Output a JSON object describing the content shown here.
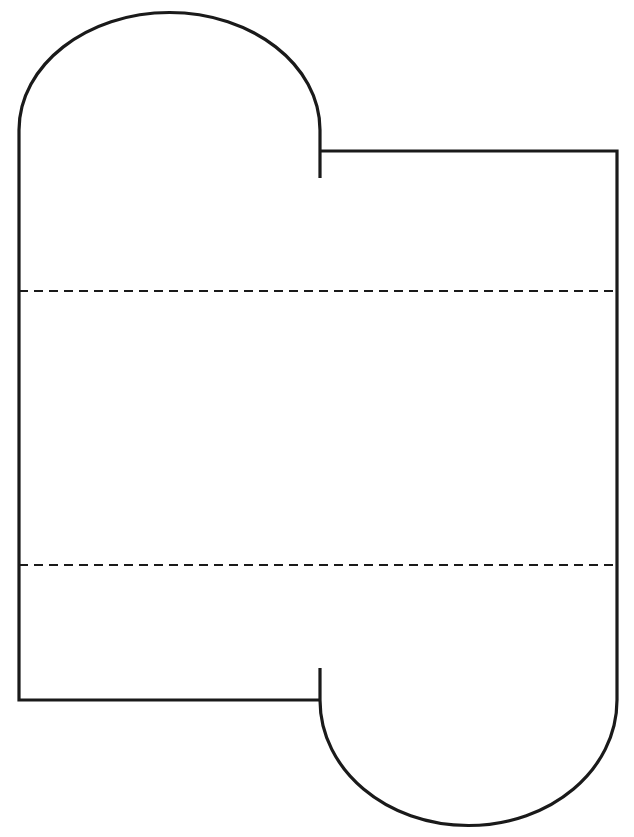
{
  "document": {
    "title": "Pattern Template Outline",
    "background_color": "#ffffff",
    "width": 634,
    "height": 837
  },
  "style": {
    "stroke_color": "#1a1a1a",
    "outline_stroke_width": 3.2,
    "fold_stroke_width": 2.2,
    "fold_dash_pattern": "9 6",
    "fill_color": "none"
  },
  "diagram": {
    "kind": "line-art-pattern-template",
    "shapes": [
      {
        "name": "left-panel-outline",
        "label": "Left panel with rounded top",
        "top_arc_apex_y": 12,
        "left_edge_x": 19,
        "right_edge_x": 320,
        "bottom_edge_y": 700,
        "arc_tangent_y": 130
      },
      {
        "name": "right-panel-outline",
        "label": "Right panel with rounded bottom",
        "top_edge_y": 151,
        "left_edge_x": 320,
        "right_edge_x": 617,
        "bottom_arc_base_y": 826,
        "arc_tangent_y": 700
      }
    ],
    "fold_lines": [
      {
        "name": "upper-fold-line",
        "label": "Upper dashed fold line",
        "y": 291,
        "x_start": 19,
        "x_end": 617
      },
      {
        "name": "lower-fold-line",
        "label": "Lower dashed fold line",
        "y": 565,
        "x_start": 19,
        "x_end": 617
      }
    ],
    "notch_stubs": [
      {
        "name": "top-notch-stub",
        "label": "Upper vertical notch stub",
        "x": 320,
        "y_start": 130,
        "y_end": 178
      },
      {
        "name": "bottom-notch-stub",
        "label": "Lower vertical notch stub",
        "x": 320,
        "y_start": 668,
        "y_end": 700
      }
    ]
  },
  "paths": {
    "left_panel": "M 320 178 L 320 130 C 320 65 252 12.5 169.5 12.5 C 87 12.5 19 65 19 130 L 19 700 L 320 700",
    "right_panel": "M 320 668 L 320 700 C 320 770 386.5 825.5 468.5 825.5 C 550.5 825.5 617 770 617 700 L 617 151 L 320 151",
    "upper_fold": "M 19 291 L 617 291",
    "lower_fold": "M 19 565 L 617 565"
  }
}
